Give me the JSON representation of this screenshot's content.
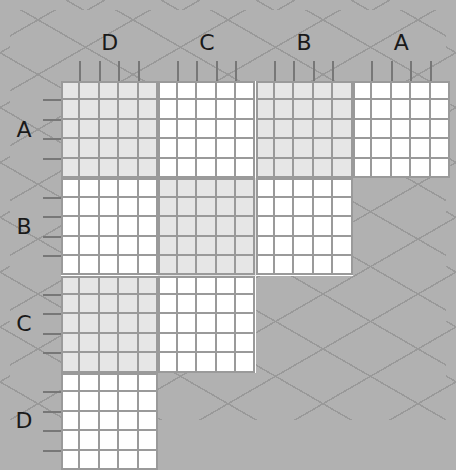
{
  "puzzle": {
    "type": "logic-grid",
    "column_groups": [
      "D",
      "C",
      "B",
      "A"
    ],
    "row_groups": [
      "A",
      "B",
      "C",
      "D"
    ],
    "items_per_group": 5,
    "blocks": [
      {
        "row": "A",
        "col": "D",
        "shade": "shaded"
      },
      {
        "row": "A",
        "col": "C",
        "shade": "white"
      },
      {
        "row": "A",
        "col": "B",
        "shade": "shaded"
      },
      {
        "row": "A",
        "col": "A",
        "shade": "white"
      },
      {
        "row": "B",
        "col": "D",
        "shade": "white"
      },
      {
        "row": "B",
        "col": "C",
        "shade": "shaded"
      },
      {
        "row": "B",
        "col": "B",
        "shade": "white"
      },
      {
        "row": "C",
        "col": "D",
        "shade": "shaded"
      },
      {
        "row": "C",
        "col": "C",
        "shade": "white"
      },
      {
        "row": "D",
        "col": "D",
        "shade": "white"
      }
    ]
  },
  "colors": {
    "background": "#b1b1b1",
    "shaded_cell": "#e6e6e6",
    "white_cell": "#ffffff",
    "grid_line": "#9a9a9a",
    "label": "#1a1a1a"
  }
}
